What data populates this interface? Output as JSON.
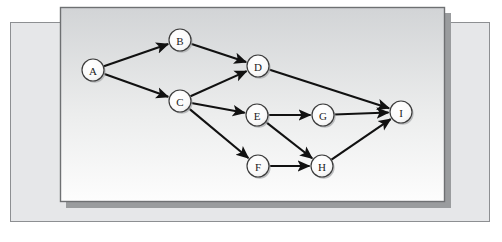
{
  "figure": {
    "type": "node-link-diagram"
  },
  "colors": {
    "back_panel_fill": "#e6e7e9",
    "back_panel_border": "#8d8f92",
    "front_panel_top": "#d2d4d6",
    "front_panel_bottom": "#fdfdfd",
    "front_panel_border": "#6e7072",
    "front_panel_shadow": "#9a9c9e",
    "node_fill": "#fbfbfb",
    "node_stroke": "#3b3b3b",
    "node_shadow": "#a9abad",
    "edge_stroke": "#111111",
    "label_color": "#1c1c1c",
    "page_background": "#ffffff"
  },
  "panels": {
    "back": {
      "x": 10,
      "y": 22,
      "width": 480,
      "height": 200
    },
    "front": {
      "x": 60,
      "y": 7,
      "width": 385,
      "height": 195
    },
    "front_shadow_offset": 6
  },
  "graph": {
    "node_radius": 11,
    "nodes": [
      {
        "id": "A",
        "label": "A",
        "x": 93,
        "y": 70
      },
      {
        "id": "B",
        "label": "B",
        "x": 180,
        "y": 40
      },
      {
        "id": "C",
        "label": "C",
        "x": 180,
        "y": 101
      },
      {
        "id": "D",
        "label": "D",
        "x": 258,
        "y": 66
      },
      {
        "id": "E",
        "label": "E",
        "x": 257,
        "y": 115
      },
      {
        "id": "F",
        "label": "F",
        "x": 258,
        "y": 166
      },
      {
        "id": "G",
        "label": "G",
        "x": 323,
        "y": 115
      },
      {
        "id": "H",
        "label": "H",
        "x": 322,
        "y": 166
      },
      {
        "id": "I",
        "label": "I",
        "x": 401,
        "y": 112
      }
    ],
    "edges": [
      {
        "from": "A",
        "to": "B"
      },
      {
        "from": "A",
        "to": "C"
      },
      {
        "from": "B",
        "to": "D"
      },
      {
        "from": "C",
        "to": "D"
      },
      {
        "from": "C",
        "to": "E"
      },
      {
        "from": "C",
        "to": "F"
      },
      {
        "from": "D",
        "to": "I"
      },
      {
        "from": "E",
        "to": "G"
      },
      {
        "from": "E",
        "to": "H"
      },
      {
        "from": "F",
        "to": "H"
      },
      {
        "from": "G",
        "to": "I"
      },
      {
        "from": "H",
        "to": "I"
      }
    ]
  }
}
